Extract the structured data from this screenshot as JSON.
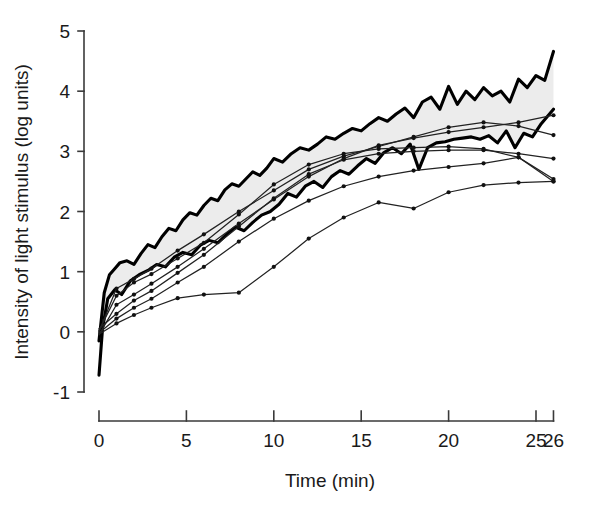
{
  "chart_data": {
    "type": "line",
    "title": "",
    "xlabel": "Time (min)",
    "ylabel": "Intensity of light stimulus (log units)",
    "xlim": [
      0,
      26
    ],
    "ylim": [
      -1,
      5
    ],
    "grid": false,
    "legend_position": "none",
    "x_ticks": [
      0,
      5,
      10,
      15,
      20,
      25,
      26
    ],
    "x_tick_labels": [
      "0",
      "5",
      "10",
      "15",
      "20",
      "25",
      "26"
    ],
    "y_ticks": [
      -1,
      0,
      1,
      2,
      3,
      4,
      5
    ],
    "y_tick_labels": [
      "-1",
      "0",
      "1",
      "2",
      "3",
      "4",
      "5"
    ],
    "shaded_band": {
      "description": "grey band bounded above by the upper envelope curve and below by the lower envelope curve",
      "color": "#ececec"
    },
    "series": [
      {
        "name": "upper-envelope",
        "style": "thick-jagged-line",
        "markers": false,
        "x": [
          0.0,
          0.3,
          0.6,
          0.9,
          1.2,
          1.6,
          2.0,
          2.4,
          2.8,
          3.2,
          3.6,
          4.0,
          4.4,
          4.8,
          5.2,
          5.6,
          6.0,
          6.4,
          6.8,
          7.2,
          7.6,
          8.0,
          8.4,
          8.8,
          9.2,
          9.6,
          10.0,
          10.5,
          11.0,
          11.5,
          12.0,
          12.5,
          13.0,
          13.5,
          14.0,
          14.5,
          15.0,
          15.5,
          16.0,
          16.5,
          17.0,
          17.5,
          18.0,
          18.5,
          19.0,
          19.5,
          20.0,
          20.5,
          21.0,
          21.5,
          22.0,
          22.5,
          23.0,
          23.5,
          24.0,
          24.5,
          25.0,
          25.5,
          26.0
        ],
        "y": [
          -0.15,
          0.65,
          0.95,
          1.05,
          1.15,
          1.18,
          1.12,
          1.3,
          1.45,
          1.4,
          1.58,
          1.72,
          1.68,
          1.86,
          1.98,
          1.94,
          2.1,
          2.22,
          2.18,
          2.36,
          2.46,
          2.42,
          2.54,
          2.66,
          2.6,
          2.72,
          2.88,
          2.82,
          2.96,
          3.06,
          3.02,
          3.12,
          3.24,
          3.2,
          3.3,
          3.38,
          3.34,
          3.46,
          3.56,
          3.5,
          3.62,
          3.72,
          3.56,
          3.82,
          3.9,
          3.7,
          4.08,
          3.78,
          4.0,
          3.86,
          4.06,
          3.92,
          4.0,
          3.82,
          4.2,
          4.06,
          4.26,
          4.18,
          4.66
        ]
      },
      {
        "name": "lower-envelope",
        "style": "thick-jagged-line",
        "markers": false,
        "x": [
          0.0,
          0.2,
          0.5,
          0.9,
          1.3,
          1.8,
          2.3,
          2.8,
          3.3,
          3.8,
          4.3,
          4.8,
          5.3,
          5.8,
          6.3,
          6.8,
          7.3,
          7.8,
          8.3,
          8.8,
          9.3,
          9.8,
          10.3,
          10.8,
          11.3,
          11.8,
          12.3,
          12.8,
          13.3,
          13.8,
          14.3,
          14.8,
          15.3,
          15.8,
          16.3,
          16.8,
          17.3,
          17.8,
          18.3,
          18.8,
          19.3,
          19.8,
          20.3,
          20.8,
          21.3,
          21.8,
          22.3,
          22.8,
          23.3,
          23.8,
          24.3,
          24.8,
          25.3,
          26.0
        ],
        "y": [
          -0.72,
          0.05,
          0.55,
          0.7,
          0.62,
          0.85,
          0.95,
          1.02,
          1.12,
          1.08,
          1.24,
          1.32,
          1.28,
          1.44,
          1.52,
          1.48,
          1.62,
          1.74,
          1.68,
          1.82,
          1.94,
          2.0,
          2.12,
          2.3,
          2.24,
          2.42,
          2.5,
          2.4,
          2.58,
          2.68,
          2.62,
          2.76,
          2.88,
          2.8,
          2.98,
          3.06,
          2.96,
          3.12,
          2.7,
          3.06,
          3.14,
          3.16,
          3.2,
          3.22,
          3.24,
          3.2,
          3.26,
          3.14,
          3.34,
          3.06,
          3.3,
          3.24,
          3.46,
          3.7
        ]
      },
      {
        "name": "subject-1",
        "style": "thin-line-with-dots",
        "markers": true,
        "x": [
          0.0,
          1.0,
          2.0,
          3.0,
          4.5,
          6.0,
          8.0,
          10.0,
          12.0,
          14.0,
          16.0,
          18.0,
          20.0,
          22.0,
          24.0,
          26.0
        ],
        "y": [
          0.0,
          0.72,
          0.88,
          1.05,
          1.35,
          1.62,
          2.0,
          2.35,
          2.7,
          2.92,
          3.08,
          3.24,
          3.4,
          3.48,
          3.42,
          3.27
        ]
      },
      {
        "name": "subject-2",
        "style": "thin-line-with-dots",
        "markers": true,
        "x": [
          0.0,
          1.0,
          2.0,
          3.0,
          4.5,
          6.0,
          8.0,
          10.0,
          12.0,
          14.0,
          16.0,
          18.0,
          20.0,
          22.0,
          24.0,
          26.0
        ],
        "y": [
          -0.05,
          0.45,
          0.62,
          0.8,
          1.08,
          1.38,
          1.8,
          2.2,
          2.58,
          2.88,
          3.1,
          3.22,
          3.32,
          3.4,
          3.48,
          3.6
        ]
      },
      {
        "name": "subject-3",
        "style": "thin-line-with-dots",
        "markers": true,
        "x": [
          0.0,
          1.0,
          2.0,
          3.0,
          4.5,
          6.0,
          8.0,
          10.0,
          12.0,
          14.0,
          16.0,
          18.0,
          20.0,
          22.0,
          24.0,
          26.0
        ],
        "y": [
          0.05,
          0.3,
          0.52,
          0.68,
          0.98,
          1.28,
          1.75,
          2.22,
          2.62,
          2.86,
          2.96,
          3.0,
          3.02,
          3.02,
          2.96,
          2.88
        ]
      },
      {
        "name": "subject-4",
        "style": "thin-line-with-dots",
        "markers": true,
        "x": [
          0.0,
          1.0,
          2.0,
          3.0,
          4.5,
          6.0,
          8.0,
          10.0,
          12.0,
          14.0,
          16.0,
          18.0,
          20.0,
          22.0,
          24.0,
          26.0
        ],
        "y": [
          -0.02,
          0.22,
          0.4,
          0.55,
          0.82,
          1.08,
          1.5,
          1.88,
          2.18,
          2.42,
          2.58,
          2.68,
          2.74,
          2.8,
          2.9,
          2.5
        ]
      },
      {
        "name": "subject-5",
        "style": "thin-line-with-dots",
        "markers": true,
        "x": [
          0.0,
          1.0,
          2.0,
          3.0,
          4.5,
          6.0,
          8.0,
          10.0,
          12.0,
          14.0,
          16.0,
          18.0,
          20.0,
          22.0,
          24.0,
          26.0
        ],
        "y": [
          0.02,
          0.6,
          0.82,
          0.96,
          1.22,
          1.48,
          1.95,
          2.45,
          2.78,
          2.96,
          3.04,
          3.06,
          3.08,
          3.04,
          2.9,
          2.54
        ]
      },
      {
        "name": "subject-6",
        "style": "thin-line-with-dots",
        "markers": true,
        "x": [
          0.0,
          1.0,
          2.0,
          3.0,
          4.5,
          6.0,
          8.0,
          10.0,
          12.0,
          14.0,
          16.0,
          18.0,
          20.0,
          22.0,
          24.0,
          26.0
        ],
        "y": [
          -0.04,
          0.14,
          0.28,
          0.4,
          0.56,
          0.62,
          0.65,
          1.08,
          1.55,
          1.9,
          2.15,
          2.05,
          2.32,
          2.44,
          2.48,
          2.5
        ]
      }
    ]
  },
  "axes": {
    "x_title": "Time (min)",
    "y_title": "Intensity of light stimulus (log units)"
  }
}
